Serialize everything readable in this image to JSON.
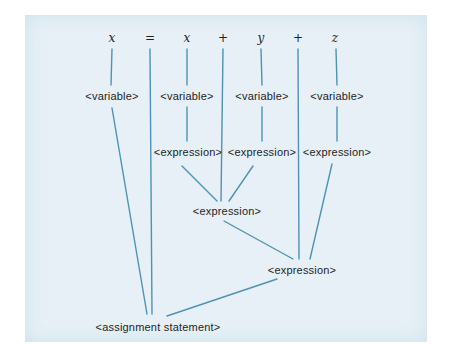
{
  "diagram": {
    "colors": {
      "panel_background": "#e6f0f6",
      "page_background": "#ffffff",
      "edge_stroke": "#4e92b4",
      "text": "#1e1e1e"
    },
    "tokens": [
      {
        "id": "token-x1",
        "label": "x",
        "x": 112,
        "y": 38
      },
      {
        "id": "token-eq",
        "label": "=",
        "x": 150,
        "y": 38
      },
      {
        "id": "token-x2",
        "label": "x",
        "x": 187,
        "y": 38
      },
      {
        "id": "token-plus1",
        "label": "+",
        "x": 223,
        "y": 38
      },
      {
        "id": "token-y",
        "label": "y",
        "x": 261,
        "y": 38
      },
      {
        "id": "token-plus2",
        "label": "+",
        "x": 298,
        "y": 38
      },
      {
        "id": "token-z",
        "label": "z",
        "x": 335,
        "y": 38
      }
    ],
    "nodes": [
      {
        "id": "variable-1",
        "label": "<variable>",
        "x": 112,
        "y": 96
      },
      {
        "id": "variable-2",
        "label": "<variable>",
        "x": 187,
        "y": 96
      },
      {
        "id": "variable-3",
        "label": "<variable>",
        "x": 262,
        "y": 96
      },
      {
        "id": "variable-4",
        "label": "<variable>",
        "x": 337,
        "y": 96
      },
      {
        "id": "expression-1",
        "label": "<expression>",
        "x": 188,
        "y": 152
      },
      {
        "id": "expression-2",
        "label": "<expression>",
        "x": 262,
        "y": 152
      },
      {
        "id": "expression-3",
        "label": "<expression>",
        "x": 337,
        "y": 152
      },
      {
        "id": "expression-center",
        "label": "<expression>",
        "x": 227,
        "y": 211
      },
      {
        "id": "expression-right",
        "label": "<expression>",
        "x": 302,
        "y": 270
      },
      {
        "id": "assignment-statement",
        "label": "<assignment statement>",
        "x": 158,
        "y": 327
      }
    ],
    "edges": [
      {
        "from": "token-x1",
        "to": "variable-1",
        "x1": 112,
        "y1": 49,
        "x2": 111,
        "y2": 85
      },
      {
        "from": "token-eq",
        "to": "assignment-statement",
        "x1": 150,
        "y1": 49,
        "x2": 152,
        "y2": 314
      },
      {
        "from": "token-x2",
        "to": "variable-2",
        "x1": 187,
        "y1": 49,
        "x2": 187,
        "y2": 85
      },
      {
        "from": "token-plus1",
        "to": "expression-center",
        "x1": 223,
        "y1": 49,
        "x2": 221,
        "y2": 201
      },
      {
        "from": "token-y",
        "to": "variable-3",
        "x1": 261,
        "y1": 49,
        "x2": 262,
        "y2": 85
      },
      {
        "from": "token-plus2",
        "to": "expression-right",
        "x1": 298,
        "y1": 49,
        "x2": 299,
        "y2": 259
      },
      {
        "from": "token-z",
        "to": "variable-4",
        "x1": 336,
        "y1": 49,
        "x2": 337,
        "y2": 85
      },
      {
        "from": "variable-1",
        "to": "assignment-statement",
        "x1": 112,
        "y1": 108,
        "x2": 147,
        "y2": 314
      },
      {
        "from": "variable-2",
        "to": "expression-1",
        "x1": 187,
        "y1": 107,
        "x2": 187,
        "y2": 141
      },
      {
        "from": "variable-3",
        "to": "expression-2",
        "x1": 262,
        "y1": 107,
        "x2": 262,
        "y2": 141
      },
      {
        "from": "variable-4",
        "to": "expression-3",
        "x1": 337,
        "y1": 107,
        "x2": 337,
        "y2": 141
      },
      {
        "from": "expression-1",
        "to": "expression-center",
        "x1": 182,
        "y1": 166,
        "x2": 217,
        "y2": 201
      },
      {
        "from": "expression-2",
        "to": "expression-center",
        "x1": 253,
        "y1": 166,
        "x2": 229,
        "y2": 201
      },
      {
        "from": "expression-3",
        "to": "expression-right",
        "x1": 332,
        "y1": 164,
        "x2": 310,
        "y2": 259
      },
      {
        "from": "expression-center",
        "to": "expression-right",
        "x1": 224,
        "y1": 221,
        "x2": 293,
        "y2": 259
      },
      {
        "from": "expression-right",
        "to": "assignment-statement",
        "x1": 277,
        "y1": 279,
        "x2": 167,
        "y2": 316
      }
    ]
  }
}
